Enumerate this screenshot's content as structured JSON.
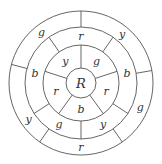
{
  "diagram": {
    "center_label": "R",
    "rings": [
      {
        "name": "ring-1",
        "sectors": [
          {
            "label": "g",
            "position": "upper-right"
          },
          {
            "label": "r",
            "position": "right"
          },
          {
            "label": "b",
            "position": "bottom"
          },
          {
            "label": "r",
            "position": "left"
          },
          {
            "label": "y",
            "position": "upper-left"
          }
        ]
      },
      {
        "name": "ring-2",
        "sectors": [
          {
            "label": "r",
            "position": "top"
          },
          {
            "label": "b",
            "position": "right"
          },
          {
            "label": "y",
            "position": "lower-right"
          },
          {
            "label": "g",
            "position": "lower-left"
          },
          {
            "label": "b",
            "position": "left"
          }
        ]
      },
      {
        "name": "ring-3",
        "sectors": [
          {
            "label": "y",
            "position": "upper-right"
          },
          {
            "label": "g",
            "position": "right"
          },
          {
            "label": "r",
            "position": "bottom"
          },
          {
            "label": "y",
            "position": "left"
          },
          {
            "label": "g",
            "position": "upper-left"
          }
        ]
      }
    ]
  }
}
